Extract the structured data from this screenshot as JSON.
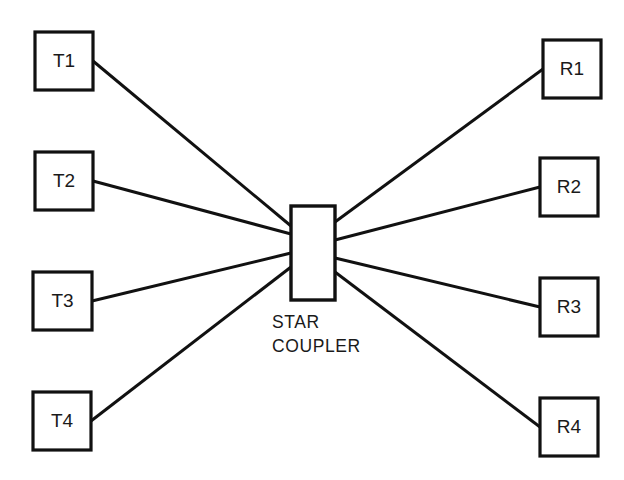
{
  "diagram": {
    "background_color": "#ffffff",
    "line_color": "#111111",
    "text_color": "#1a1a1a",
    "coupler": {
      "caption_line1": "STAR",
      "caption_line2": "COUPLER",
      "x": 291,
      "y": 206,
      "width": 44,
      "height": 94,
      "caption_x": 272,
      "caption_line1_y": 328,
      "caption_line2_y": 352
    },
    "transmitters": [
      {
        "label": "T1",
        "x": 35,
        "y": 32,
        "width": 58,
        "height": 58,
        "port_x": 291,
        "port_y": 226
      },
      {
        "label": "T2",
        "x": 35,
        "y": 152,
        "width": 58,
        "height": 58,
        "port_x": 291,
        "port_y": 234
      },
      {
        "label": "T3",
        "x": 33,
        "y": 272,
        "width": 59,
        "height": 58,
        "port_x": 291,
        "port_y": 253
      },
      {
        "label": "T4",
        "x": 33,
        "y": 392,
        "width": 58,
        "height": 58,
        "port_x": 291,
        "port_y": 267
      }
    ],
    "receivers": [
      {
        "label": "R1",
        "x": 543,
        "y": 40,
        "width": 58,
        "height": 58,
        "port_x": 335,
        "port_y": 222
      },
      {
        "label": "R2",
        "x": 540,
        "y": 158,
        "width": 58,
        "height": 58,
        "port_x": 335,
        "port_y": 240
      },
      {
        "label": "R3",
        "x": 540,
        "y": 278,
        "width": 58,
        "height": 58,
        "port_x": 335,
        "port_y": 258
      },
      {
        "label": "R4",
        "x": 540,
        "y": 398,
        "width": 58,
        "height": 58,
        "port_x": 335,
        "port_y": 272
      }
    ]
  }
}
